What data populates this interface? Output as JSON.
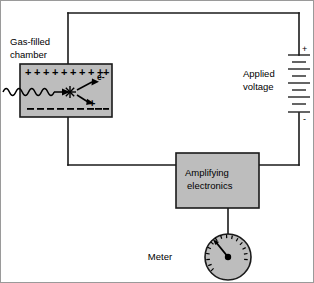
{
  "diagram": {
    "colors": {
      "box_fill": "#bdbdbd",
      "wire": "#1a1a1a",
      "text": "#000000",
      "background": "#ffffff"
    },
    "labels": {
      "chamber_line1": "Gas-filled",
      "chamber_line2": "chamber",
      "applied_line1": "Applied",
      "applied_line2": "voltage",
      "amplifier_line1": "Amplifying",
      "amplifier_line2": "electronics",
      "meter": "Meter",
      "electron": "e-",
      "ion": "+",
      "battery_positive": "+",
      "battery_negative": "-"
    },
    "chamber": {
      "top_charge_symbol": "+",
      "top_charge_count": 10,
      "bottom_charge_symbol": "-",
      "bottom_charge_count": 9,
      "incident_radiation": "wavy-photon-arrow",
      "interaction_marker": "ionization-starburst"
    },
    "battery": {
      "cells": 4,
      "positive_terminal": "+",
      "negative_terminal": "-"
    },
    "meter": {
      "tick_count": 15,
      "needle_direction": "upper-left",
      "needle_angle_deg": -128
    }
  }
}
